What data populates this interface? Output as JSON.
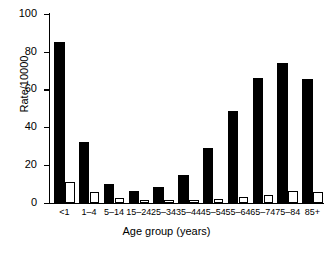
{
  "chart_data": {
    "type": "bar",
    "title": "",
    "xlabel": "Age group (years)",
    "ylabel": "Rate/10000",
    "categories": [
      "<1",
      "1–4",
      "5–14",
      "15–24",
      "25–34",
      "35–44",
      "45–54",
      "55–64",
      "65–74",
      "75–84",
      "85+"
    ],
    "ylim": [
      0,
      100
    ],
    "yticks": [
      0,
      20,
      40,
      60,
      80,
      100
    ],
    "ytick_labels": [
      "0",
      "20",
      "40",
      "60",
      "80",
      "100"
    ],
    "grid": false,
    "legend": "none",
    "series": [
      {
        "name": "black-series",
        "color": "#000000",
        "fill": "solid",
        "values": [
          85,
          32,
          10,
          6,
          8.5,
          14.5,
          29,
          48.5,
          66,
          74,
          65.5
        ]
      },
      {
        "name": "white-series",
        "color": "#ffffff",
        "fill": "open",
        "values": [
          11,
          5.5,
          2.5,
          0.8,
          1,
          1.5,
          2,
          3,
          4,
          6,
          5.5
        ]
      }
    ]
  },
  "axes": {
    "y_title": "Rate/10000",
    "x_title": "Age group (years)"
  }
}
